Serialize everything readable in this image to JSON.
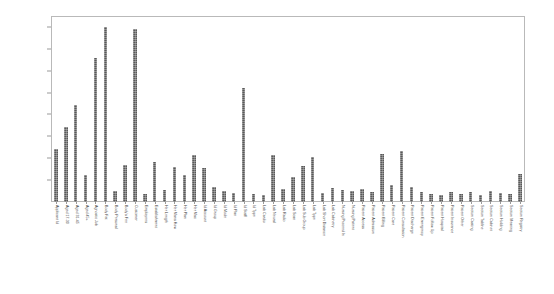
{
  "chart_data": {
    "type": "bar",
    "title": "",
    "subtitle": "",
    "xlabel": "",
    "ylabel": "",
    "ylim": [
      0,
      17000
    ],
    "grid": false,
    "legend": false,
    "legend_position": "none",
    "bar_color": "#595959",
    "frame_color": "#b9b9b9",
    "y_ticks": [
      2000,
      4000,
      6000,
      8000,
      10000,
      12000,
      14000,
      16000
    ],
    "y_tick_labels": [
      "2000",
      "4000",
      "6000",
      "8000",
      "10000",
      "12000",
      "14000",
      "16000"
    ],
    "categories": [
      "Applicant Id",
      "Aged 17-30",
      "Aged 31-45",
      "Aged 45+",
      "Agnostic Job",
      "Body Fat",
      "Body Personal",
      "Body's Fee",
      "Customer",
      "Employees",
      "Establishment",
      "Her Length",
      "Her Mans How",
      "Her Plan",
      "Her Mac",
      "Id Account",
      "Id Group",
      "Id Mode",
      "Id Plan",
      "Id Staff",
      "Id Type",
      "Lab Cardio",
      "Lab Neural",
      "Lab Radio",
      "Lab Scan",
      "Lab Sub Group",
      "Lab Type",
      "Lab Short Distance",
      "Lab Cabinetry",
      "Nursing Proceed In",
      "Nursing Patient",
      "Patient Access",
      "Patient Admission",
      "Patient Billing",
      "Patient Care",
      "Patient Consultation",
      "Patient Discharge",
      "Patient Emergency",
      "Patient Follow Up",
      "Patient Hospital",
      "Patient Insurance",
      "Patient Other",
      "Section Casting",
      "Section Tabline",
      "Section Cabinet",
      "Section Holding",
      "Section Meaning",
      "Section Registry"
    ],
    "values": [
      4800,
      6900,
      8900,
      2500,
      13200,
      16000,
      1000,
      3400,
      15800,
      700,
      3700,
      1100,
      3200,
      2500,
      4300,
      3100,
      1400,
      1000,
      800,
      10400,
      700,
      600,
      4300,
      1200,
      2300,
      3300,
      4100,
      800,
      1300,
      1100,
      1000,
      1200,
      900,
      4400,
      1600,
      4700,
      1400,
      900,
      700,
      600,
      900,
      700,
      900,
      600,
      1000,
      800,
      700,
      2600
    ]
  }
}
